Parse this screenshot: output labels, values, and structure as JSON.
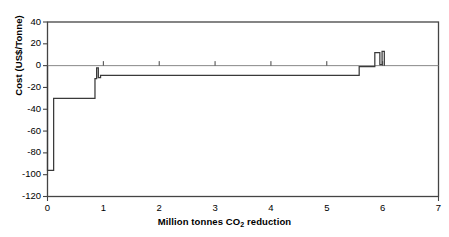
{
  "chart_data": {
    "type": "bar",
    "title": "",
    "subtitle": "",
    "xlabel_prefix": "Million tonnes CO",
    "xlabel_sub": "2",
    "xlabel_suffix": " reduction",
    "xlabel": "Million tonnes CO2 reduction",
    "ylabel": "Cost (US$/Tonne)",
    "xlim": [
      0,
      7
    ],
    "ylim": [
      -120,
      40
    ],
    "xticks": [
      0,
      1,
      2,
      3,
      4,
      5,
      6,
      7
    ],
    "xtick_labels": [
      "0",
      "1",
      "2",
      "3",
      "4",
      "5",
      "6",
      "7"
    ],
    "yticks": [
      40,
      20,
      0,
      -20,
      -40,
      -60,
      -80,
      -100,
      -120
    ],
    "ytick_labels": [
      "40",
      "20",
      "0",
      "-20",
      "-40",
      "-60",
      "-80",
      "-100",
      "-120"
    ],
    "grid": false,
    "legend": null,
    "zero_line": 0,
    "line_color": "#3a3a3a",
    "axis_color": "#444444",
    "zero_line_color": "#888888",
    "background": "#ffffff",
    "steps": [
      {
        "x_start": 0.0,
        "x_end": 0.11,
        "cost": -96
      },
      {
        "x_start": 0.11,
        "x_end": 0.85,
        "cost": -30
      },
      {
        "x_start": 0.85,
        "x_end": 0.88,
        "cost": -12
      },
      {
        "x_start": 0.88,
        "x_end": 0.91,
        "cost": -2
      },
      {
        "x_start": 0.91,
        "x_end": 0.95,
        "cost": -11
      },
      {
        "x_start": 0.95,
        "x_end": 5.58,
        "cost": -9
      },
      {
        "x_start": 5.58,
        "x_end": 5.86,
        "cost": -1
      },
      {
        "x_start": 5.86,
        "x_end": 5.95,
        "cost": 12
      },
      {
        "x_start": 5.95,
        "x_end": 5.99,
        "cost": 1
      },
      {
        "x_start": 5.99,
        "x_end": 6.03,
        "cost": 13
      }
    ]
  }
}
